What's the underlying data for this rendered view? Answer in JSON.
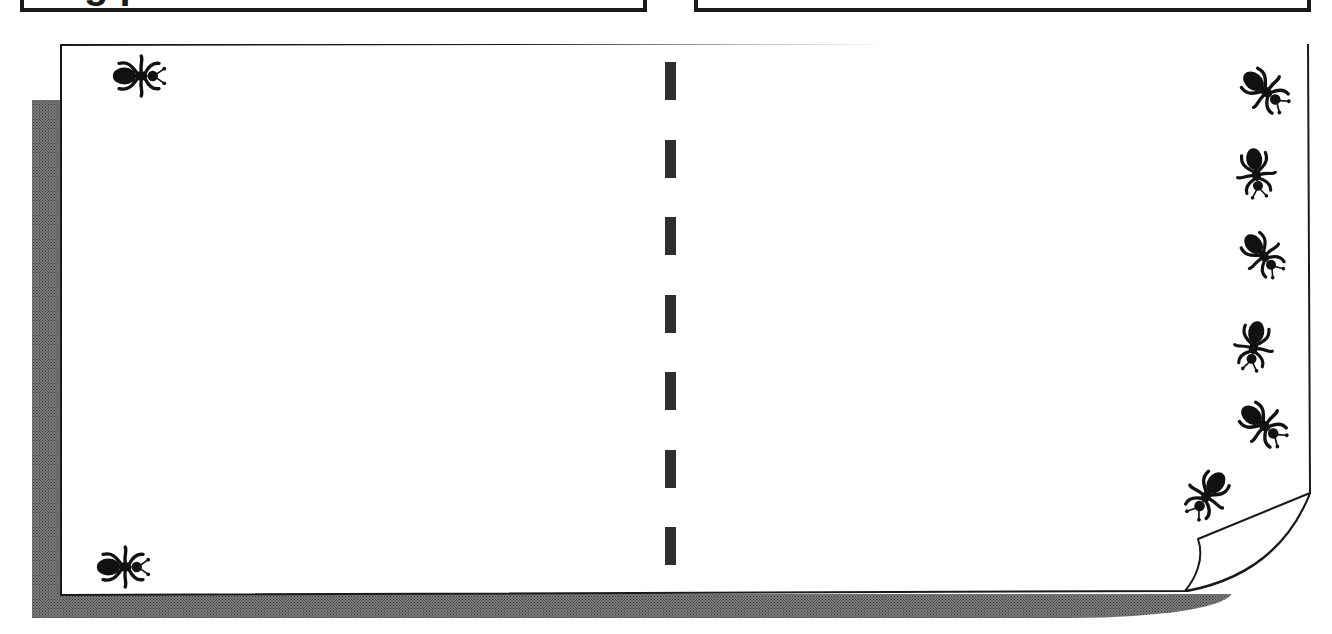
{
  "top_boxes": [
    {
      "id": "left",
      "title": "g  p"
    },
    {
      "id": "right",
      "title": ""
    }
  ],
  "page": {
    "background": "#ffffff",
    "border_color": "#1a1a1a",
    "shadow_color": "#6e6e6e",
    "corner": "curled-bottom-right"
  },
  "divider": {
    "style": "dashed",
    "color": "#555555",
    "dash_count": 7,
    "dash_y": [
      62,
      140,
      217,
      295,
      372,
      450,
      527
    ]
  },
  "decorations": {
    "icon": "ant-icon",
    "count": 8,
    "positions": [
      {
        "name": "ant-top-left",
        "x": 100,
        "y": 52,
        "rotate": 90
      },
      {
        "name": "ant-bottom-left",
        "x": 84,
        "y": 543,
        "rotate": 90
      },
      {
        "name": "ant-right-1",
        "x": 1228,
        "y": 62,
        "rotate": 130
      },
      {
        "name": "ant-right-2",
        "x": 1230,
        "y": 143,
        "rotate": 170
      },
      {
        "name": "ant-right-3",
        "x": 1228,
        "y": 225,
        "rotate": 130
      },
      {
        "name": "ant-right-4",
        "x": 1226,
        "y": 316,
        "rotate": 190
      },
      {
        "name": "ant-right-5",
        "x": 1226,
        "y": 396,
        "rotate": 130
      },
      {
        "name": "ant-right-6",
        "x": 1174,
        "y": 464,
        "rotate": 215
      }
    ]
  }
}
